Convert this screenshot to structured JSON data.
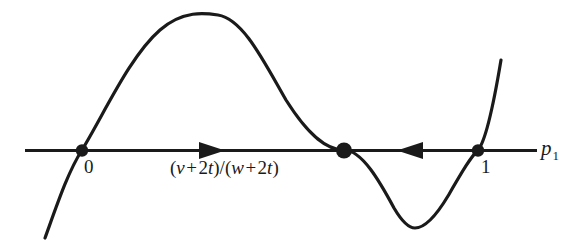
{
  "figure": {
    "kind": "phase-line-diagram",
    "background_color": "#ffffff",
    "stroke_color": "#1a1a1a",
    "width": 581,
    "height": 252
  },
  "axis": {
    "name": "horizontal-axis",
    "label_variable": "p",
    "label_subscript": "1",
    "y_position": 150,
    "x_start": 25,
    "x_end": 537
  },
  "equilibria": [
    {
      "id": "zero",
      "label": "0",
      "x": 82,
      "stability": "unstable",
      "dot_radius": 6
    },
    {
      "id": "interior",
      "label_parts": {
        "open1": "(",
        "v": "v",
        "plus1": "+",
        "two_t_1": "2t",
        "close1": ")",
        "slash": "/",
        "open2": "(",
        "w": "w",
        "plus2": "+",
        "two_t_2": "2t",
        "close2": ")"
      },
      "label_plain": "(v + 2t)/(w + 2t)",
      "x": 344,
      "stability": "stable",
      "dot_radius": 8
    },
    {
      "id": "one",
      "label": "1",
      "x": 478,
      "stability": "unstable",
      "dot_radius": 6
    }
  ],
  "flow_arrows": [
    {
      "id": "arrow-rightward",
      "direction": "right",
      "x": 212,
      "y": 150
    },
    {
      "id": "arrow-leftward",
      "direction": "left",
      "x": 410,
      "y": 150
    }
  ],
  "chart_data": {
    "type": "line",
    "title": "",
    "xlabel": "p_1",
    "ylabel": "",
    "grid": false,
    "legend": null,
    "axis_baseline_y": 150,
    "roots_x": [
      82,
      344,
      478
    ],
    "extrema": [
      {
        "type": "maximum",
        "x": 218,
        "y": 15
      },
      {
        "type": "minimum",
        "x": 415,
        "y": 228
      }
    ],
    "endpoints": [
      {
        "x": 45,
        "y": 238
      },
      {
        "x": 501,
        "y": 60
      }
    ],
    "path": "M 45 238 C 58 202 68 172 82 150 C 104 114 130 56 160 30 C 183 10 205 13 218 15 C 243 19 263 60 286 100 C 310 138 328 150 344 150 C 362 150 380 182 394 208 C 404 225 410 228 415 228 C 424 228 436 216 448 196 C 462 172 470 158 478 150 C 486 141 494 102 501 60"
  }
}
